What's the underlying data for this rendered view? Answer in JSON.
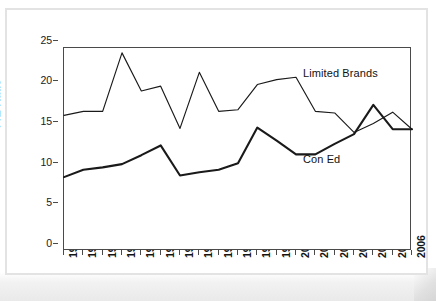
{
  "chart_data": {
    "type": "line",
    "title": "",
    "xlabel": "",
    "ylabel": "P/E Ratio",
    "ylim": [
      0,
      25
    ],
    "yticks": [
      0,
      5,
      10,
      15,
      20,
      25
    ],
    "grid": false,
    "legend_position": "inline-annotations",
    "categories": [
      "1988",
      "1989",
      "1990",
      "1991",
      "1992",
      "1993",
      "1994",
      "1995",
      "1996",
      "1997",
      "1998",
      "1999",
      "2000",
      "2001",
      "2002",
      "2003",
      "2004",
      "2005",
      "2006"
    ],
    "series": [
      {
        "name": "Limited Brands",
        "label_text": "Limited Brands",
        "values": [
          16.7,
          17.2,
          17.2,
          24.4,
          19.7,
          20.3,
          15.1,
          22.0,
          17.2,
          17.4,
          20.5,
          21.1,
          21.4,
          17.2,
          17.0,
          14.6,
          15.7,
          17.1,
          15.0
        ]
      },
      {
        "name": "Con Ed",
        "label_text": "Con Ed",
        "values": [
          9.1,
          10.0,
          10.3,
          10.7,
          11.8,
          13.0,
          9.3,
          9.7,
          10.0,
          10.8,
          15.2,
          13.6,
          11.9,
          11.9,
          13.2,
          14.4,
          18.0,
          15.0,
          15.0
        ]
      }
    ]
  },
  "axis": {
    "y_title": "P/E Ratio",
    "y_tick_labels": [
      "25",
      "20",
      "15",
      "10",
      "5",
      "0"
    ],
    "x_tick_labels": [
      "1988",
      "1989",
      "1990",
      "1991",
      "1992",
      "1993",
      "1994",
      "1995",
      "1996",
      "1997",
      "1998",
      "1999",
      "2000",
      "2001",
      "2002",
      "2003",
      "2004",
      "2005",
      "2006"
    ]
  },
  "annotations": {
    "limited_brands": "Limited Brands",
    "con_ed": "Con Ed"
  },
  "colors": {
    "line": "#1a1a1a",
    "axis": "#4a4a4a",
    "frame": "#e3e3e3",
    "background": "#ffffff"
  }
}
